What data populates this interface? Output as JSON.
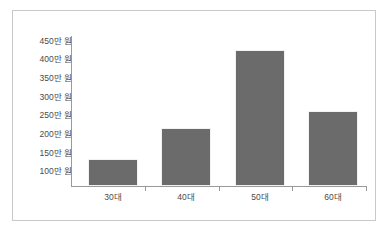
{
  "chart_data": {
    "type": "bar",
    "title": "",
    "xlabel": "",
    "ylabel": "",
    "categories": [
      "30대",
      "40대",
      "50대",
      "60대"
    ],
    "values": [
      135,
      218,
      428,
      265
    ],
    "value_unit": "만 원",
    "y_tick_labels": [
      "450만 원",
      "400만 원",
      "350만 원",
      "300만 원",
      "250만 원",
      "200만 원",
      "150만 원",
      "100만 원"
    ],
    "y_tick_values": [
      450,
      400,
      350,
      300,
      250,
      200,
      150,
      100
    ],
    "ylim": [
      62,
      470
    ],
    "grid": false,
    "legend": null,
    "legend_position": "none",
    "series": [
      {
        "name": "금액",
        "values": [
          135,
          218,
          428,
          265
        ]
      }
    ],
    "bar_color": "#6b6b6b",
    "axis_color": "#9a9a9a",
    "text_color": "#4a4a4a",
    "frame_color": "#c9c9c9",
    "background_color": "#ffffff"
  }
}
